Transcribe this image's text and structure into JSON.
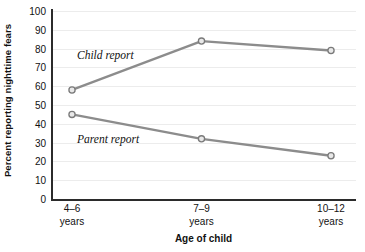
{
  "chart_data": {
    "type": "line",
    "title": "",
    "xlabel": "Age of child",
    "ylabel": "Percent reporting nighttime fears",
    "categories": [
      "4–6 years",
      "7–9 years",
      "10–12 years"
    ],
    "category_lines": [
      {
        "line1": "4–6",
        "line2": "years"
      },
      {
        "line1": "7–9",
        "line2": "years"
      },
      {
        "line1": "10–12",
        "line2": "years"
      }
    ],
    "ylim": [
      0,
      100
    ],
    "ytick_values": [
      0,
      10,
      20,
      30,
      40,
      50,
      60,
      70,
      80,
      90,
      100
    ],
    "ytick_labels": [
      "0",
      "10",
      "20",
      "30",
      "40",
      "50",
      "60",
      "70",
      "80",
      "90",
      "100"
    ],
    "grid": true,
    "legend_position": "inline-annotation",
    "series": [
      {
        "name": "Child report",
        "values": [
          58,
          84,
          79
        ],
        "color": "#8c8c8c"
      },
      {
        "name": "Parent report",
        "values": [
          45,
          32,
          23
        ],
        "color": "#8c8c8c"
      }
    ],
    "annotations": [
      {
        "text": "Child report",
        "series": "Child report"
      },
      {
        "text": "Parent report",
        "series": "Parent report"
      }
    ]
  },
  "style": {
    "line_color": "#8c8c8c",
    "marker_fill": "#e8e8e8",
    "marker_edge": "#7a7a7a",
    "axis_color": "#2b2b2b",
    "grid_color": "#ececec",
    "text_color": "#111111",
    "background": "#ffffff"
  }
}
